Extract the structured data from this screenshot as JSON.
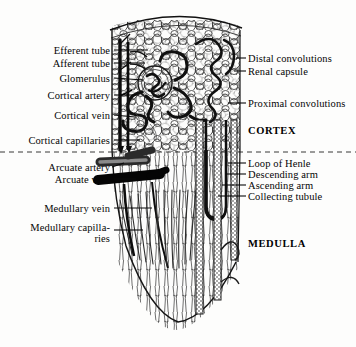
{
  "figure": {
    "style": "engraved line drawing",
    "ink_color": "#121212",
    "paper_color": "#fdfdfc"
  },
  "labels_left": [
    {
      "id": "efferent-tube",
      "text": "Efferent tube",
      "x": 14,
      "y": 45,
      "w": 96,
      "leader": {
        "x1": 114,
        "y1": 50,
        "x2": 148,
        "y2": 50
      }
    },
    {
      "id": "afferent-tube",
      "text": "Afferent tube",
      "x": 14,
      "y": 58,
      "w": 96,
      "leader": {
        "x1": 114,
        "y1": 63,
        "x2": 145,
        "y2": 63
      }
    },
    {
      "id": "glomerulus",
      "text": "Glomerulus",
      "x": 14,
      "y": 73,
      "w": 96,
      "leader": {
        "x1": 114,
        "y1": 78,
        "x2": 143,
        "y2": 80
      }
    },
    {
      "id": "cortical-artery",
      "text": "Cortical artery",
      "x": 10,
      "y": 90,
      "w": 100,
      "leader": {
        "x1": 114,
        "y1": 95,
        "x2": 139,
        "y2": 95
      }
    },
    {
      "id": "cortical-vein",
      "text": "Cortical vein",
      "x": 10,
      "y": 110,
      "w": 100,
      "leader": {
        "x1": 114,
        "y1": 115,
        "x2": 135,
        "y2": 117
      }
    },
    {
      "id": "cortical-capillaries",
      "text": "Cortical capillaries",
      "x": 2,
      "y": 135,
      "w": 108,
      "leader": {
        "x1": 114,
        "y1": 140,
        "x2": 140,
        "y2": 140
      }
    },
    {
      "id": "arcuate-artery",
      "text": "Arcuate artery",
      "x": 10,
      "y": 162,
      "w": 100,
      "leader": {
        "x1": 112,
        "y1": 167,
        "x2": 124,
        "y2": 163
      }
    },
    {
      "id": "arcuate-vein",
      "text": "Arcuate vein",
      "x": 10,
      "y": 174,
      "w": 100,
      "leader": {
        "x1": 114,
        "y1": 179,
        "x2": 136,
        "y2": 179
      }
    },
    {
      "id": "medullary-vein",
      "text": "Medullary vein",
      "x": 10,
      "y": 203,
      "w": 100,
      "leader": {
        "x1": 114,
        "y1": 208,
        "x2": 152,
        "y2": 208
      }
    },
    {
      "id": "medullary-capillaries",
      "text": "Medullary capilla-\nries",
      "x": 2,
      "y": 222,
      "w": 108,
      "leader": {
        "x1": 114,
        "y1": 230,
        "x2": 143,
        "y2": 230
      }
    }
  ],
  "labels_right": [
    {
      "id": "distal-convolutions",
      "text": "Distal convolutions",
      "x": 248,
      "y": 53,
      "leader": {
        "x1": 236,
        "y1": 58,
        "x2": 246,
        "y2": 58
      }
    },
    {
      "id": "renal-capsule",
      "text": "Renal capsule",
      "x": 248,
      "y": 66,
      "leader": {
        "x1": 234,
        "y1": 71,
        "x2": 246,
        "y2": 71
      }
    },
    {
      "id": "proximal-convolutions",
      "text": "Proximal convolutions",
      "x": 248,
      "y": 98,
      "leader": {
        "x1": 228,
        "y1": 103,
        "x2": 246,
        "y2": 103
      }
    },
    {
      "id": "loop-of-henle",
      "text": "Loop of Henle",
      "x": 248,
      "y": 158,
      "leader": {
        "x1": 228,
        "y1": 163,
        "x2": 246,
        "y2": 163
      }
    },
    {
      "id": "descending-arm",
      "text": "Descending arm",
      "x": 248,
      "y": 169,
      "leader": {
        "x1": 226,
        "y1": 174,
        "x2": 246,
        "y2": 174
      }
    },
    {
      "id": "ascending-arm",
      "text": "Ascending arm",
      "x": 248,
      "y": 180,
      "leader": {
        "x1": 222,
        "y1": 185,
        "x2": 246,
        "y2": 185
      }
    },
    {
      "id": "collecting-tubule",
      "text": "Collecting tubule",
      "x": 248,
      "y": 191,
      "leader": {
        "x1": 218,
        "y1": 196,
        "x2": 246,
        "y2": 196
      }
    }
  ],
  "regions": [
    {
      "id": "cortex",
      "text": "CORTEX",
      "x": 248,
      "y": 125
    },
    {
      "id": "medulla",
      "text": "MEDULLA",
      "x": 248,
      "y": 238
    }
  ]
}
